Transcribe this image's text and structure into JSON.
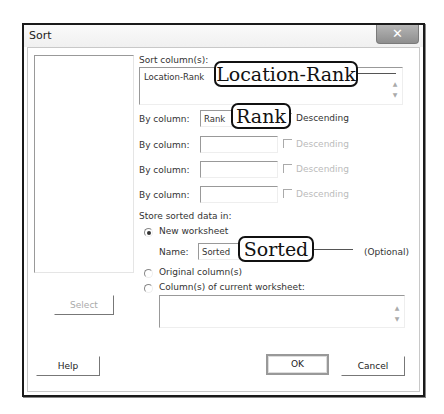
{
  "window": {
    "title": "Sort",
    "close_icon": "close-x-icon"
  },
  "sort_columns": {
    "label": "Sort column(s):",
    "value": "Location-Rank",
    "callout": "Location-Rank"
  },
  "by_columns": [
    {
      "label": "By column:",
      "value": "Rank",
      "callout": "Rank",
      "descending_label": "Descending",
      "descending_enabled": true,
      "descending_checked": false
    },
    {
      "label": "By column:",
      "value": "",
      "descending_label": "Descending",
      "descending_enabled": false,
      "descending_checked": false
    },
    {
      "label": "By column:",
      "value": "",
      "descending_label": "Descending",
      "descending_enabled": false,
      "descending_checked": false
    },
    {
      "label": "By column:",
      "value": "",
      "descending_label": "Descending",
      "descending_enabled": false,
      "descending_checked": false
    }
  ],
  "store": {
    "label": "Store sorted data in:",
    "options": [
      {
        "label": "New worksheet",
        "checked": true
      },
      {
        "label": "Original column(s)",
        "checked": false
      },
      {
        "label": "Column(s) of current worksheet:",
        "checked": false
      }
    ],
    "name_label": "Name:",
    "name_value": "Sorted",
    "name_callout": "Sorted",
    "optional_label": "(Optional)",
    "columns_value": ""
  },
  "buttons": {
    "select": "Select",
    "help": "Help",
    "ok": "OK",
    "cancel": "Cancel"
  }
}
